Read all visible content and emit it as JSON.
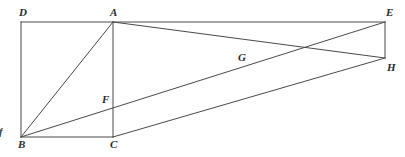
{
  "figure": {
    "background_color": "#ffffff",
    "stroke_color": "#4a4a4a",
    "label_color": "#2b2b2b",
    "stroke_width": 1,
    "width": 405,
    "height": 157
  },
  "points": {
    "D": {
      "label": "D",
      "x": 21,
      "y": 22,
      "label_x": 19,
      "label_y": 7
    },
    "A": {
      "label": "A",
      "x": 113,
      "y": 22,
      "label_x": 110,
      "label_y": 7
    },
    "E": {
      "label": "E",
      "x": 385,
      "y": 22,
      "label_x": 386,
      "label_y": 7
    },
    "H": {
      "label": "H",
      "x": 385,
      "y": 58,
      "label_x": 387,
      "label_y": 62
    },
    "G": {
      "label": "G",
      "x": 243,
      "y": 65,
      "label_x": 238,
      "label_y": 52
    },
    "F": {
      "label": "F",
      "x": 113,
      "y": 105,
      "label_x": 102,
      "label_y": 94
    },
    "B": {
      "label": "B",
      "x": 21,
      "y": 137,
      "label_x": 18,
      "label_y": 139
    },
    "C": {
      "label": "C",
      "x": 113,
      "y": 137,
      "label_x": 110,
      "label_y": 139
    }
  },
  "edges": [
    {
      "name": "edge-D-A",
      "from": "D",
      "to": "A"
    },
    {
      "name": "edge-A-E",
      "from": "A",
      "to": "E"
    },
    {
      "name": "edge-D-B",
      "from": "D",
      "to": "B"
    },
    {
      "name": "edge-A-C",
      "from": "A",
      "to": "C"
    },
    {
      "name": "edge-B-C",
      "from": "B",
      "to": "C"
    },
    {
      "name": "edge-E-H",
      "from": "E",
      "to": "H"
    },
    {
      "name": "edge-A-B-diagonal",
      "from": "A",
      "to": "B"
    },
    {
      "name": "edge-A-H-diagonal",
      "from": "A",
      "to": "H"
    },
    {
      "name": "edge-B-E-diagonal",
      "from": "B",
      "to": "E"
    },
    {
      "name": "edge-C-H-diagonal",
      "from": "C",
      "to": "H"
    }
  ],
  "artifacts": {
    "left_edge_glyph": "f"
  }
}
